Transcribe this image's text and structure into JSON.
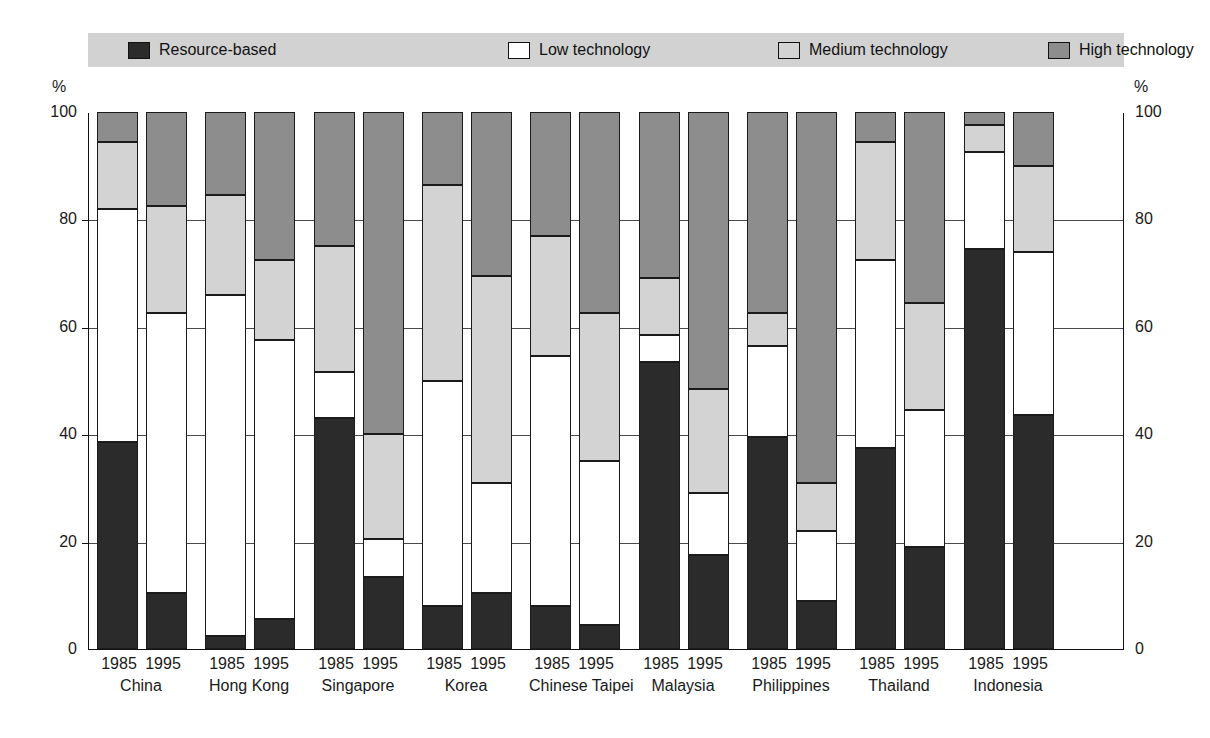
{
  "legend": {
    "items": [
      {
        "label": "Resource-based",
        "key": "resource",
        "color": "#2b2b2b"
      },
      {
        "label": "Low technology",
        "key": "low",
        "color": "#ffffff"
      },
      {
        "label": "Medium technology",
        "key": "medium",
        "color": "#d3d3d3"
      },
      {
        "label": "High technology",
        "key": "high",
        "color": "#8d8d8d"
      }
    ],
    "background_color": "#d2d2d2"
  },
  "axis": {
    "unit_left": "%",
    "unit_right": "%",
    "ticks": [
      "100",
      "80",
      "60",
      "40",
      "20",
      "0"
    ]
  },
  "chart_data": {
    "type": "bar",
    "subtype": "stacked-100-percent",
    "title": "",
    "xlabel": "",
    "ylabel": "%",
    "ylim": [
      0,
      100
    ],
    "yticks": [
      0,
      20,
      40,
      60,
      80,
      100
    ],
    "grid": true,
    "legend_position": "top",
    "series": [
      {
        "name": "Resource-based",
        "color": "#2b2b2b",
        "values": [
          38.5,
          10.5,
          2.5,
          5.5,
          43.0,
          13.5,
          8.0,
          10.5,
          8.0,
          4.5,
          53.5,
          17.5,
          39.5,
          9.0,
          37.5,
          19.0,
          74.5,
          43.5
        ]
      },
      {
        "name": "Low technology",
        "color": "#ffffff",
        "values": [
          43.5,
          52.0,
          63.5,
          52.0,
          8.5,
          7.0,
          42.0,
          20.5,
          46.5,
          30.5,
          5.0,
          11.5,
          17.0,
          13.0,
          35.0,
          25.5,
          18.0,
          30.5
        ]
      },
      {
        "name": "Medium technology",
        "color": "#d3d3d3",
        "values": [
          12.5,
          20.0,
          18.5,
          15.0,
          23.5,
          19.5,
          36.5,
          38.5,
          22.5,
          27.5,
          10.5,
          19.5,
          6.0,
          9.0,
          22.0,
          20.0,
          5.0,
          16.0
        ]
      },
      {
        "name": "High technology",
        "color": "#8d8d8d",
        "values": [
          5.5,
          17.5,
          15.5,
          27.5,
          25.0,
          60.0,
          13.5,
          30.5,
          23.0,
          37.5,
          31.0,
          51.5,
          37.5,
          69.0,
          5.5,
          35.5,
          2.5,
          10.0
        ]
      }
    ],
    "categories": [
      "China 1985",
      "China 1995",
      "Hong Kong 1985",
      "Hong Kong 1995",
      "Singapore 1985",
      "Singapore 1995",
      "Korea 1985",
      "Korea 1995",
      "Chinese Taipei 1985",
      "Chinese Taipei 1995",
      "Malaysia 1985",
      "Malaysia 1995",
      "Philippines 1985",
      "Philippines 1995",
      "Thailand 1985",
      "Thailand 1995",
      "Indonesia 1985",
      "Indonesia 1995"
    ],
    "groups": [
      {
        "economy": "China",
        "years": [
          "1985",
          "1995"
        ],
        "bars": [
          {
            "year": "1985",
            "resource": 38.5,
            "low": 43.5,
            "medium": 12.5,
            "high": 5.5
          },
          {
            "year": "1995",
            "resource": 10.5,
            "low": 52.0,
            "medium": 20.0,
            "high": 17.5
          }
        ]
      },
      {
        "economy": "Hong Kong",
        "years": [
          "1985",
          "1995"
        ],
        "bars": [
          {
            "year": "1985",
            "resource": 2.5,
            "low": 63.5,
            "medium": 18.5,
            "high": 15.5
          },
          {
            "year": "1995",
            "resource": 5.5,
            "low": 52.0,
            "medium": 15.0,
            "high": 27.5
          }
        ]
      },
      {
        "economy": "Singapore",
        "years": [
          "1985",
          "1995"
        ],
        "bars": [
          {
            "year": "1985",
            "resource": 43.0,
            "low": 8.5,
            "medium": 23.5,
            "high": 25.0
          },
          {
            "year": "1995",
            "resource": 13.5,
            "low": 7.0,
            "medium": 19.5,
            "high": 60.0
          }
        ]
      },
      {
        "economy": "Korea",
        "years": [
          "1985",
          "1995"
        ],
        "bars": [
          {
            "year": "1985",
            "resource": 8.0,
            "low": 42.0,
            "medium": 36.5,
            "high": 13.5
          },
          {
            "year": "1995",
            "resource": 10.5,
            "low": 20.5,
            "medium": 38.5,
            "high": 30.5
          }
        ]
      },
      {
        "economy": "Chinese Taipei",
        "years": [
          "1985",
          "1995"
        ],
        "bars": [
          {
            "year": "1985",
            "resource": 8.0,
            "low": 46.5,
            "medium": 22.5,
            "high": 23.0
          },
          {
            "year": "1995",
            "resource": 4.5,
            "low": 30.5,
            "medium": 27.5,
            "high": 37.5
          }
        ]
      },
      {
        "economy": "Malaysia",
        "years": [
          "1985",
          "1995"
        ],
        "bars": [
          {
            "year": "1985",
            "resource": 53.5,
            "low": 5.0,
            "medium": 10.5,
            "high": 31.0
          },
          {
            "year": "1995",
            "resource": 17.5,
            "low": 11.5,
            "medium": 19.5,
            "high": 51.5
          }
        ]
      },
      {
        "economy": "Philippines",
        "years": [
          "1985",
          "1995"
        ],
        "bars": [
          {
            "year": "1985",
            "resource": 39.5,
            "low": 17.0,
            "medium": 6.0,
            "high": 37.5
          },
          {
            "year": "1995",
            "resource": 9.0,
            "low": 13.0,
            "medium": 9.0,
            "high": 69.0
          }
        ]
      },
      {
        "economy": "Thailand",
        "years": [
          "1985",
          "1995"
        ],
        "bars": [
          {
            "year": "1985",
            "resource": 37.5,
            "low": 35.0,
            "medium": 22.0,
            "high": 5.5
          },
          {
            "year": "1995",
            "resource": 19.0,
            "low": 25.5,
            "medium": 20.0,
            "high": 35.5
          }
        ]
      },
      {
        "economy": "Indonesia",
        "years": [
          "1985",
          "1995"
        ],
        "bars": [
          {
            "year": "1985",
            "resource": 74.5,
            "low": 18.0,
            "medium": 5.0,
            "high": 2.5
          },
          {
            "year": "1995",
            "resource": 43.5,
            "low": 30.5,
            "medium": 16.0,
            "high": 10.0
          }
        ]
      }
    ]
  }
}
